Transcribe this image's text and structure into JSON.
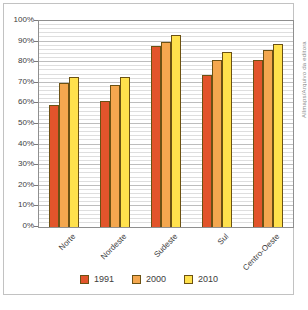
{
  "figure": {
    "credit": "Allmaps/Arquivo da editora"
  },
  "chart_data": {
    "type": "bar",
    "title": "",
    "xlabel": "",
    "ylabel": "",
    "categories": [
      "Norte",
      "Nordeste",
      "Sudeste",
      "Sul",
      "Centro-Oeste"
    ],
    "series": [
      {
        "name": "1991",
        "color": "#e2542b",
        "values": [
          59,
          61,
          88,
          74,
          81
        ]
      },
      {
        "name": "2000",
        "color": "#f4a74f",
        "values": [
          70,
          69,
          90,
          81,
          86
        ]
      },
      {
        "name": "2010",
        "color": "#ffe14c",
        "values": [
          73,
          73,
          93,
          85,
          89
        ]
      }
    ],
    "ylim": [
      0,
      100
    ],
    "ytick_step": 10,
    "minor_grid_step": 2,
    "ytick_suffix": "%",
    "grid": true,
    "legend_position": "bottom",
    "colors": {
      "bar_border": "#6b5113",
      "minor_grid": "#dedede",
      "major_grid": "#bdbdbd",
      "plot_border": "#8f8f8f",
      "label_text": "#3c3c3c",
      "credit_text": "#8a8a8a"
    }
  }
}
